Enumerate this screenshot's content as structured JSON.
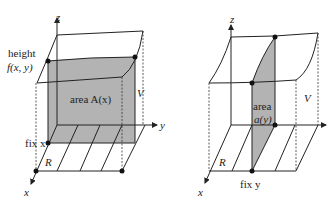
{
  "left_figure": {
    "axes": {
      "z": "z",
      "y": "y",
      "x": "x"
    },
    "height_label_1": "height",
    "height_label_2": "f(x, y)",
    "area_label": "area A(x)",
    "volume_label": "V",
    "fix_label": "fix x",
    "region_label": "R"
  },
  "right_figure": {
    "axes": {
      "z": "z",
      "x": "x"
    },
    "area_label_1": "area",
    "area_label_2": "a(y)",
    "volume_label": "V",
    "fix_label": "fix y",
    "region_label": "R"
  },
  "colors": {
    "shade": "#b3b3b3",
    "line": "#222222",
    "background": "#ffffff"
  }
}
